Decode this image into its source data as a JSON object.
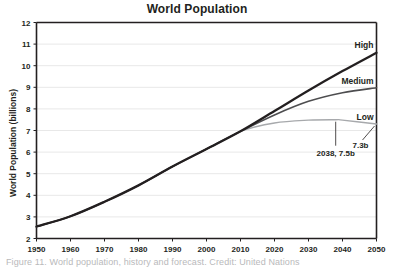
{
  "figure": {
    "caption": "Figure 11. World population, history and forecast. Credit: United Nations"
  },
  "chart_data": {
    "type": "line",
    "title": "World Population",
    "xlabel": "",
    "ylabel": "World Population (billions)",
    "xlim": [
      1950,
      2050
    ],
    "ylim": [
      2,
      12
    ],
    "grid": true,
    "legend_position": "inline-right-of-series",
    "xticks": [
      "1950",
      "1960",
      "1970",
      "1980",
      "1990",
      "2000",
      "2010",
      "2020",
      "2030",
      "2040",
      "2050"
    ],
    "yticks": [
      "2",
      "3",
      "4",
      "5",
      "6",
      "7",
      "8",
      "9",
      "10",
      "11",
      "12"
    ],
    "colors": {
      "high": "#231f20",
      "medium": "#4d4d4f",
      "low": "#a7a9ac",
      "gridline": "#e8e8e8",
      "axis": "#231f20"
    },
    "series": [
      {
        "name": "High",
        "label": "High",
        "color": "#231f20",
        "x": [
          1950,
          1960,
          1970,
          1980,
          1990,
          2000,
          2010,
          2020,
          2030,
          2040,
          2050
        ],
        "values": [
          2.55,
          3.03,
          3.7,
          4.46,
          5.33,
          6.14,
          6.96,
          7.9,
          8.85,
          9.75,
          10.6
        ]
      },
      {
        "name": "Medium",
        "label": "Medium",
        "color": "#4d4d4f",
        "x": [
          1950,
          1960,
          1970,
          1980,
          1990,
          2000,
          2010,
          2020,
          2030,
          2040,
          2050
        ],
        "values": [
          2.55,
          3.03,
          3.7,
          4.46,
          5.33,
          6.14,
          6.96,
          7.72,
          8.35,
          8.75,
          8.98
        ]
      },
      {
        "name": "Low",
        "label": "Low",
        "color": "#a7a9ac",
        "x": [
          1950,
          1960,
          1970,
          1980,
          1990,
          2000,
          2010,
          2020,
          2030,
          2038,
          2040,
          2050
        ],
        "values": [
          2.55,
          3.03,
          3.7,
          4.46,
          5.33,
          6.14,
          6.96,
          7.35,
          7.48,
          7.5,
          7.48,
          7.3
        ]
      }
    ],
    "annotations": [
      {
        "name": "low-peak",
        "label": "2038, 7.5b",
        "x": 2038,
        "y": 7.5
      },
      {
        "name": "low-endpoint",
        "label": "7.3b",
        "x": 2050,
        "y": 7.3
      }
    ]
  }
}
